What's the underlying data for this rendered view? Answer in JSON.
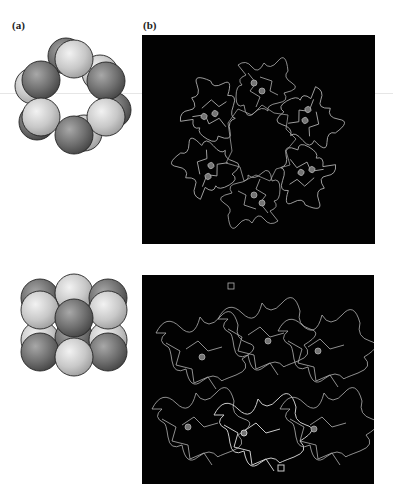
{
  "figure": {
    "panel_a_label": "(a)",
    "panel_b_label": "(b)",
    "panels": [
      {
        "id": "a-top",
        "description": "hexameric ring sphere model (top view)",
        "sphere_light": "#cfcfcf",
        "sphere_dark": "#7a7a7a"
      },
      {
        "id": "a-bottom",
        "description": "hexamer sphere model (side view, 2 stacked trimers)"
      },
      {
        "id": "b-top",
        "description": "ribbon structure of hexameric protein, top view",
        "background": "#020202"
      },
      {
        "id": "b-bottom",
        "description": "ribbon structure of hexameric protein, side view",
        "background": "#020202"
      }
    ]
  }
}
